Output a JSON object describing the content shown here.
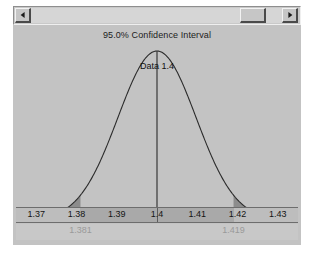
{
  "window": {
    "background_color": "#c3c3c3"
  },
  "scrollbar": {
    "left_arrow_icon": "triangle-left-icon",
    "right_arrow_icon": "triangle-right-icon",
    "thumb_position_percent": 93
  },
  "chart_data": {
    "type": "line",
    "title": "95.0% Confidence Interval",
    "xlabel": "",
    "ylabel": "",
    "xlim": [
      1.365,
      1.435
    ],
    "ylim": [
      0,
      1
    ],
    "grid": false,
    "legend": null,
    "distribution": "normal",
    "mean": 1.4,
    "std_dev": 0.0097,
    "confidence_level": "95.0%",
    "tick_labels": [
      "1.37",
      "1.38",
      "1.39",
      "1.4",
      "1.41",
      "1.42",
      "1.43"
    ],
    "tick_values": [
      1.37,
      1.38,
      1.39,
      1.4,
      1.41,
      1.42,
      1.43
    ],
    "annotations": [
      {
        "name": "peak-label",
        "text": "Data 1.4",
        "x": 1.4
      }
    ],
    "ci_bounds": [
      {
        "name": "lower",
        "label": "1.381",
        "value": 1.381
      },
      {
        "name": "upper",
        "label": "1.419",
        "value": 1.419
      }
    ],
    "shaded_tails": [
      {
        "name": "left-tail",
        "from": 1.365,
        "to": 1.381
      },
      {
        "name": "right-tail",
        "from": 1.419,
        "to": 1.435
      }
    ],
    "center_line": {
      "x": 1.4
    },
    "colors": {
      "panel": "#c3c3c3",
      "curve": "#2b2b2b",
      "tail_fill": "#8c8c8c",
      "axis_band": "#bdbdbd",
      "axis_ci_fill": "#a9a9a9",
      "tick_text": "#141414",
      "bound_text": "#9a9a9a"
    }
  }
}
